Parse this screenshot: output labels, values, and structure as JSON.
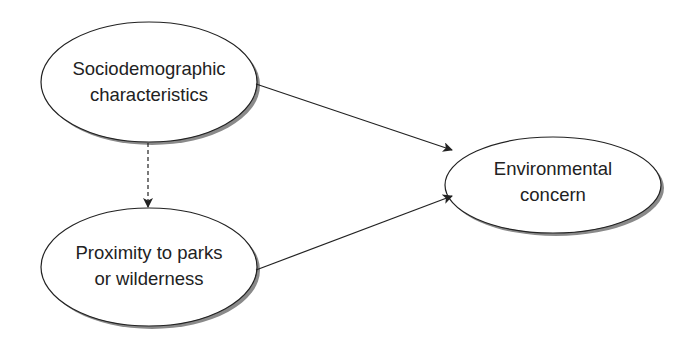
{
  "diagram": {
    "nodes": [
      {
        "id": "sociodemographic",
        "lines": [
          "Sociodemographic",
          "characteristics"
        ]
      },
      {
        "id": "proximity",
        "lines": [
          "Proximity to parks",
          "or wilderness"
        ]
      },
      {
        "id": "environmental",
        "lines": [
          "Environmental",
          "concern"
        ]
      }
    ],
    "edges": [
      {
        "from": "sociodemographic",
        "to": "environmental",
        "style": "solid"
      },
      {
        "from": "proximity",
        "to": "environmental",
        "style": "solid"
      },
      {
        "from": "sociodemographic",
        "to": "proximity",
        "style": "dashed"
      }
    ],
    "colors": {
      "stroke": "#222222",
      "shadow": "#8a8a8a",
      "fill": "#ffffff"
    }
  }
}
